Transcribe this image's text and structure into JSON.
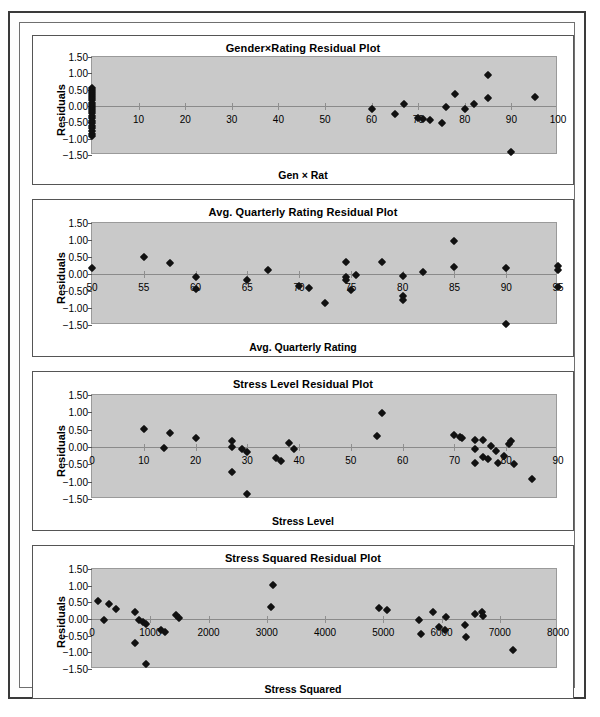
{
  "page": {
    "kind": "scanned-figure-page",
    "background": "#ffffff",
    "plot_area_color": "#c9c9c9",
    "marker_color": "#111111",
    "axis_color": "#8a8a8a"
  },
  "charts": [
    {
      "id": "gender-rating",
      "title": "Gender×Rating  Residual Plot",
      "xlabel": "Gen × Rat",
      "ylabel": "Residuals",
      "chart_data": {
        "type": "scatter",
        "title": "Gender×Rating  Residual Plot",
        "xlabel": "Gen × Rat",
        "ylabel": "Residuals",
        "xlim": [
          0,
          100
        ],
        "ylim": [
          -1.5,
          1.5
        ],
        "xticks": [
          0,
          10,
          20,
          30,
          40,
          50,
          60,
          70,
          80,
          90,
          100
        ],
        "xticklabels": [
          "",
          "10",
          "20",
          "30",
          "40",
          "50",
          "60",
          "70",
          "80",
          "90",
          "100"
        ],
        "yticks": [
          -1.5,
          -1.0,
          -0.5,
          0.0,
          0.5,
          1.0,
          1.5
        ],
        "yticklabels": [
          "−1.50",
          "−1.00",
          "−0.50",
          "0.00",
          "0.50",
          "1.00",
          "1.50"
        ],
        "grid": false,
        "legend": false,
        "points": [
          [
            0,
            0.55
          ],
          [
            0,
            0.48
          ],
          [
            0,
            0.42
          ],
          [
            0,
            0.36
          ],
          [
            0,
            0.3
          ],
          [
            0,
            0.24
          ],
          [
            0,
            0.17
          ],
          [
            0,
            0.1
          ],
          [
            0,
            0.04
          ],
          [
            0,
            -0.02
          ],
          [
            0,
            -0.09
          ],
          [
            0,
            -0.15
          ],
          [
            0,
            -0.22
          ],
          [
            0,
            -0.3
          ],
          [
            0,
            -0.37
          ],
          [
            0,
            -0.45
          ],
          [
            0,
            -0.52
          ],
          [
            0,
            -0.6
          ],
          [
            0,
            -0.68
          ],
          [
            0,
            -0.76
          ],
          [
            0,
            -0.85
          ],
          [
            0,
            -0.93
          ],
          [
            60,
            -0.1
          ],
          [
            65,
            -0.24
          ],
          [
            67,
            0.06
          ],
          [
            70,
            -0.38
          ],
          [
            71,
            -0.4
          ],
          [
            72.5,
            -0.42
          ],
          [
            75,
            -0.52
          ],
          [
            76,
            -0.04
          ],
          [
            78,
            0.36
          ],
          [
            80,
            -0.08
          ],
          [
            82,
            0.07
          ],
          [
            85,
            0.95
          ],
          [
            85,
            0.24
          ],
          [
            90,
            -1.42
          ],
          [
            95,
            0.27
          ]
        ]
      }
    },
    {
      "id": "avg-quarterly-rating",
      "title": "Avg. Quarterly Rating Residual Plot",
      "xlabel": "Avg. Quarterly Rating",
      "ylabel": "Residuals",
      "chart_data": {
        "type": "scatter",
        "title": "Avg. Quarterly Rating Residual Plot",
        "xlabel": "Avg. Quarterly Rating",
        "ylabel": "Residuals",
        "xlim": [
          50,
          95
        ],
        "ylim": [
          -1.5,
          1.5
        ],
        "xticks": [
          50,
          55,
          60,
          65,
          70,
          75,
          80,
          85,
          90,
          95
        ],
        "xticklabels": [
          "50",
          "55",
          "60",
          "65",
          "70",
          "75",
          "80",
          "85",
          "90",
          "95"
        ],
        "yticks": [
          -1.5,
          -1.0,
          -0.5,
          0.0,
          0.5,
          1.0,
          1.5
        ],
        "yticklabels": [
          "−1.50",
          "−1.00",
          "−0.50",
          "0.00",
          "0.50",
          "1.00",
          "1.50"
        ],
        "grid": false,
        "legend": false,
        "points": [
          [
            50,
            0.19
          ],
          [
            55,
            0.49
          ],
          [
            57.5,
            0.31
          ],
          [
            60,
            -0.08
          ],
          [
            60,
            -0.44
          ],
          [
            65,
            -0.18
          ],
          [
            67,
            0.12
          ],
          [
            70,
            -0.34
          ],
          [
            71,
            -0.4
          ],
          [
            72.5,
            -0.85
          ],
          [
            74.5,
            0.35
          ],
          [
            74.5,
            -0.08
          ],
          [
            74.5,
            -0.18
          ],
          [
            75.5,
            -0.04
          ],
          [
            75,
            -0.46
          ],
          [
            78,
            0.34
          ],
          [
            80,
            -0.05
          ],
          [
            80,
            -0.66
          ],
          [
            80,
            -0.76
          ],
          [
            82,
            0.07
          ],
          [
            85,
            0.96
          ],
          [
            85,
            0.21
          ],
          [
            90,
            0.17
          ],
          [
            90,
            -1.47
          ],
          [
            95,
            0.24
          ],
          [
            95,
            0.11
          ],
          [
            95,
            -0.37
          ]
        ]
      }
    },
    {
      "id": "stress-level",
      "title": "Stress Level Residual Plot",
      "xlabel": "Stress Level",
      "ylabel": "Residuals",
      "chart_data": {
        "type": "scatter",
        "title": "Stress Level Residual Plot",
        "xlabel": "Stress Level",
        "ylabel": "Residuals",
        "xlim": [
          0,
          90
        ],
        "ylim": [
          -1.5,
          1.5
        ],
        "xticks": [
          0,
          10,
          20,
          30,
          40,
          50,
          60,
          70,
          80,
          90
        ],
        "xticklabels": [
          "0",
          "10",
          "20",
          "30",
          "40",
          "50",
          "60",
          "70",
          "80",
          "90"
        ],
        "yticks": [
          -1.5,
          -1.0,
          -0.5,
          0.0,
          0.5,
          1.0,
          1.5
        ],
        "yticklabels": [
          "−1.50",
          "−1.00",
          "−0.50",
          "0.00",
          "0.50",
          "1.00",
          "1.50"
        ],
        "grid": false,
        "legend": false,
        "points": [
          [
            10,
            0.52
          ],
          [
            14,
            -0.02
          ],
          [
            15,
            0.4
          ],
          [
            20,
            0.27
          ],
          [
            27,
            0.17
          ],
          [
            27,
            0.0
          ],
          [
            27,
            -0.72
          ],
          [
            29,
            -0.05
          ],
          [
            30,
            -0.14
          ],
          [
            30,
            -1.37
          ],
          [
            35.5,
            -0.33
          ],
          [
            36.5,
            -0.4
          ],
          [
            38,
            0.12
          ],
          [
            39,
            -0.05
          ],
          [
            55,
            0.31
          ],
          [
            56,
            0.98
          ],
          [
            70,
            0.35
          ],
          [
            71,
            0.3
          ],
          [
            71.5,
            0.27
          ],
          [
            74,
            0.19
          ],
          [
            74,
            -0.07
          ],
          [
            74,
            -0.45
          ],
          [
            75.5,
            0.21
          ],
          [
            75.5,
            -0.3
          ],
          [
            76.5,
            -0.34
          ],
          [
            77,
            0.03
          ],
          [
            78,
            -0.11
          ],
          [
            78.5,
            -0.47
          ],
          [
            79.5,
            -0.25
          ],
          [
            80.5,
            0.08
          ],
          [
            81,
            0.17
          ],
          [
            81.5,
            -0.5
          ],
          [
            85,
            -0.92
          ]
        ]
      }
    },
    {
      "id": "stress-squared",
      "title": "Stress Squared Residual Plot",
      "xlabel": "Stress Squared",
      "ylabel": "Residuals",
      "chart_data": {
        "type": "scatter",
        "title": "Stress Squared Residual Plot",
        "xlabel": "Stress Squared",
        "ylabel": "Residuals",
        "xlim": [
          0,
          8000
        ],
        "ylim": [
          -1.5,
          1.5
        ],
        "xticks": [
          0,
          1000,
          2000,
          3000,
          4000,
          5000,
          6000,
          7000,
          8000
        ],
        "xticklabels": [
          "0",
          "1000",
          "2000",
          "3000",
          "4000",
          "5000",
          "6000",
          "7000",
          "8000"
        ],
        "yticks": [
          -1.5,
          -1.0,
          -0.5,
          0.0,
          0.5,
          1.0,
          1.5
        ],
        "yticklabels": [
          "−1.50",
          "−1.00",
          "−0.50",
          "0.00",
          "0.50",
          "1.00",
          "1.50"
        ],
        "grid": false,
        "legend": false,
        "points": [
          [
            100,
            0.53
          ],
          [
            200,
            -0.02
          ],
          [
            290,
            0.44
          ],
          [
            420,
            0.31
          ],
          [
            730,
            0.22
          ],
          [
            740,
            -0.72
          ],
          [
            800,
            -0.02
          ],
          [
            880,
            -0.08
          ],
          [
            930,
            -0.14
          ],
          [
            930,
            -1.35
          ],
          [
            1180,
            -0.34
          ],
          [
            1250,
            -0.4
          ],
          [
            1440,
            0.11
          ],
          [
            1490,
            0.04
          ],
          [
            3080,
            0.36
          ],
          [
            3110,
            1.03
          ],
          [
            4930,
            0.34
          ],
          [
            5070,
            0.28
          ],
          [
            5620,
            -0.03
          ],
          [
            5640,
            -0.46
          ],
          [
            5860,
            0.22
          ],
          [
            5950,
            -0.25
          ],
          [
            6060,
            -0.33
          ],
          [
            6080,
            0.05
          ],
          [
            6400,
            -0.19
          ],
          [
            6420,
            -0.53
          ],
          [
            6580,
            0.14
          ],
          [
            6700,
            0.21
          ],
          [
            6720,
            0.1
          ],
          [
            7230,
            -0.92
          ]
        ]
      }
    }
  ]
}
